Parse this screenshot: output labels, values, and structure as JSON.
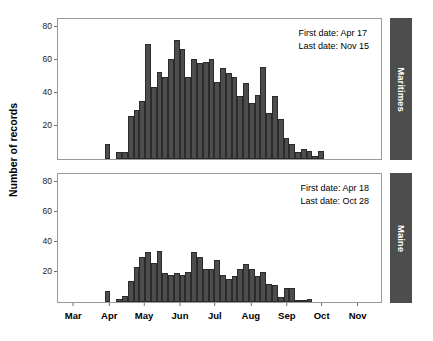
{
  "chart_data": {
    "type": "bar",
    "title": "",
    "subtitle": "",
    "xlabel": "",
    "ylabel": "Number of records",
    "grid": false,
    "legend_position": "none",
    "xlim": [
      0,
      280
    ],
    "ylim": [
      0,
      85
    ],
    "x_tick_labels": [
      "Mar",
      "Apr",
      "May",
      "Jun",
      "Jul",
      "Aug",
      "Sep",
      "Oct",
      "Nov"
    ],
    "x_tick_positions": [
      14,
      45,
      75,
      106,
      136,
      167,
      198,
      228,
      259
    ],
    "y_tick_labels": [
      "20",
      "40",
      "60",
      "80"
    ],
    "y_tick_values": [
      20,
      40,
      60,
      80
    ],
    "panels": [
      {
        "strip_label": "Maritimes",
        "annotation": {
          "first_date_label": "First date: Apr 17",
          "last_date_label": "Last date: Nov 15"
        },
        "bin_width_days": 5,
        "x": [
          38,
          43,
          48,
          53,
          58,
          63,
          68,
          73,
          78,
          83,
          88,
          93,
          98,
          103,
          108,
          113,
          118,
          123,
          128,
          133,
          138,
          143,
          148,
          153,
          158,
          163,
          168,
          173,
          178,
          183,
          188,
          193,
          198,
          203,
          208,
          213,
          218,
          223,
          228,
          233,
          238,
          243,
          248,
          253,
          258,
          263
        ],
        "values": [
          0,
          9,
          0,
          4,
          4,
          26,
          30,
          35,
          70,
          44,
          53,
          50,
          61,
          72,
          67,
          50,
          61,
          58,
          59,
          61,
          47,
          55,
          52,
          50,
          38,
          46,
          34,
          39,
          56,
          28,
          38,
          24,
          13,
          9,
          4,
          6,
          5,
          2,
          5,
          0,
          0,
          0,
          0,
          0,
          0,
          0
        ]
      },
      {
        "strip_label": "Maine",
        "annotation": {
          "first_date_label": "First date: Apr 18",
          "last_date_label": "Last date: Oct 28"
        },
        "bin_width_days": 5,
        "x": [
          38,
          43,
          48,
          53,
          58,
          63,
          68,
          73,
          78,
          83,
          88,
          93,
          98,
          103,
          108,
          113,
          118,
          123,
          128,
          133,
          138,
          143,
          148,
          153,
          158,
          163,
          168,
          173,
          178,
          183,
          188,
          193,
          198,
          203,
          208,
          213,
          218,
          223,
          228,
          233,
          238,
          243,
          248,
          253,
          258,
          263
        ],
        "values": [
          0,
          7,
          0,
          2,
          4,
          14,
          23,
          30,
          33,
          26,
          34,
          19,
          18,
          19,
          18,
          20,
          33,
          30,
          22,
          22,
          28,
          18,
          15,
          17,
          22,
          25,
          22,
          17,
          20,
          12,
          11,
          3,
          9,
          9,
          1,
          1,
          2,
          0,
          0,
          0,
          0,
          0,
          0,
          0,
          0,
          0
        ]
      }
    ],
    "colors": {
      "bar_fill": "#4d4d4d",
      "bar_outline": "#2b2b2b",
      "strip_fill": "#4d4d4d",
      "strip_text": "#ffffff",
      "panel_border": "#9a9a9a",
      "background": "#ffffff",
      "text": "#000000"
    }
  }
}
